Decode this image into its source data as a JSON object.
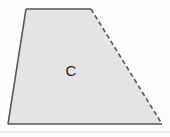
{
  "figure": {
    "type": "geometric-shape-diagram",
    "canvas": {
      "width": 170,
      "height": 137,
      "background_color": "#fdfdfd"
    },
    "shape": {
      "name": "trapezoid",
      "label": "C",
      "label_position": {
        "x": 71,
        "y": 70
      },
      "fill_color": "#e4e4e4",
      "stroke_color": "#555555",
      "stroke_width": 1.6,
      "vertices": [
        {
          "name": "top-left",
          "x": 26,
          "y": 9
        },
        {
          "name": "top-right",
          "x": 91,
          "y": 9
        },
        {
          "name": "bottom-right",
          "x": 162,
          "y": 124
        },
        {
          "name": "bottom-left",
          "x": 8,
          "y": 124
        }
      ],
      "edges": [
        {
          "name": "top-edge",
          "from": "top-left",
          "to": "top-right",
          "style": "solid"
        },
        {
          "name": "right-edge",
          "from": "top-right",
          "to": "bottom-right",
          "style": "dashed",
          "dash_pattern": "4.5 3"
        },
        {
          "name": "bottom-edge",
          "from": "bottom-right",
          "to": "bottom-left",
          "style": "solid"
        },
        {
          "name": "left-edge",
          "from": "bottom-left",
          "to": "top-left",
          "style": "solid"
        }
      ]
    },
    "artifact_line": {
      "name": "scan-artifact-line",
      "y": 132,
      "x_start": 0,
      "x_end": 170,
      "color": "#d8d8d8"
    }
  }
}
